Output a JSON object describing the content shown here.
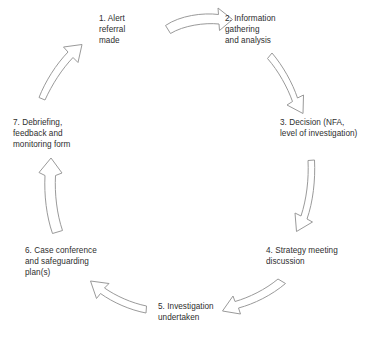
{
  "diagram": {
    "type": "circular-process-cycle",
    "direction": "clockwise",
    "step_count": 7,
    "colors": {
      "background": "#ffffff",
      "arrow_stroke": "#9a9a9a",
      "arrow_fill": "#ffffff",
      "text": "#2e2e2e"
    },
    "steps": [
      {
        "number": "1",
        "label": "1. Alert\nreferral\nmade"
      },
      {
        "number": "2",
        "label": "2. Information\ngathering\nand analysis"
      },
      {
        "number": "3",
        "label": "3. Decision (NFA,\nlevel of investigation)"
      },
      {
        "number": "4",
        "label": "4. Strategy meeting\ndiscussion"
      },
      {
        "number": "5",
        "label": "5. Investigation\nundertaken"
      },
      {
        "number": "6",
        "label": "6. Case conference\nand safeguarding\nplan(s)"
      },
      {
        "number": "7",
        "label": "7. Debriefing,\nfeedback and\nmonitoring form"
      }
    ],
    "connectors": [
      {
        "from": "1",
        "to": "2",
        "name": "arrow-1-to-2"
      },
      {
        "from": "2",
        "to": "3",
        "name": "arrow-2-to-3"
      },
      {
        "from": "3",
        "to": "4",
        "name": "arrow-3-to-4"
      },
      {
        "from": "4",
        "to": "5",
        "name": "arrow-4-to-5"
      },
      {
        "from": "5",
        "to": "6",
        "name": "arrow-5-to-6"
      },
      {
        "from": "6",
        "to": "7",
        "name": "arrow-6-to-7"
      },
      {
        "from": "7",
        "to": "1",
        "name": "arrow-7-to-1"
      }
    ]
  }
}
